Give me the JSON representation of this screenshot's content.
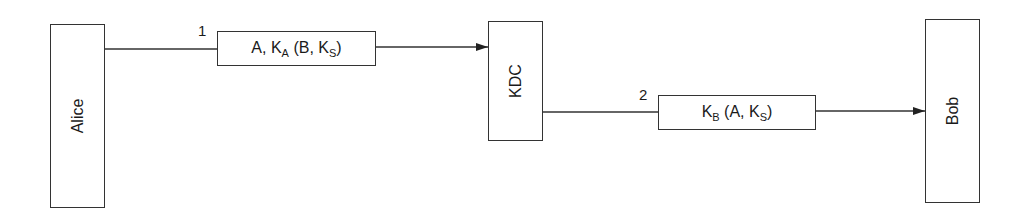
{
  "diagram": {
    "title": "",
    "entities": [
      {
        "id": "alice",
        "label": "Alice"
      },
      {
        "id": "kdc",
        "label": "KDC"
      },
      {
        "id": "bob",
        "label": "Bob"
      }
    ],
    "messages": [
      {
        "step": "1",
        "from": "Alice",
        "to": "KDC",
        "parts": {
          "a": "A, K",
          "a_sub": "A",
          "b": " (B, K",
          "b_sub": "S",
          "c": ")"
        },
        "text": "A, K_A (B, K_S)"
      },
      {
        "step": "2",
        "from": "KDC",
        "to": "Bob",
        "parts": {
          "a": "K",
          "a_sub": "B",
          "b": " (A, K",
          "b_sub": "S",
          "c": ")"
        },
        "text": "K_B (A, K_S)"
      }
    ],
    "colors": {
      "stroke": "#333333",
      "background": "#ffffff"
    }
  }
}
